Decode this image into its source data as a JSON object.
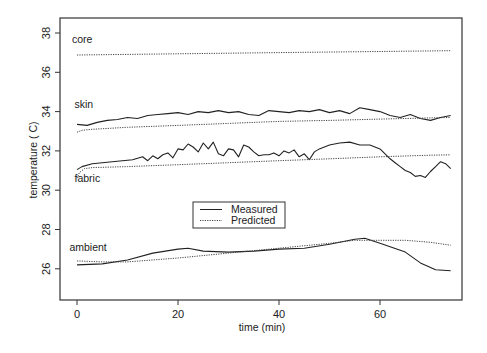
{
  "chart_data": {
    "type": "line",
    "title": "",
    "xlabel": "time (min)",
    "ylabel": "temperature ( C)",
    "xlim": [
      -3,
      77
    ],
    "ylim": [
      24.5,
      38.3
    ],
    "xticks": [
      0,
      20,
      40,
      60
    ],
    "yticks": [
      26,
      28,
      30,
      32,
      34,
      36,
      38
    ],
    "grid": false,
    "legend": {
      "position": "center",
      "entries": [
        {
          "label": "Measured",
          "style": "solid"
        },
        {
          "label": "Predicted",
          "style": "dotted"
        }
      ]
    },
    "series_labels": [
      {
        "name": "core",
        "x": -1,
        "y": 37.5
      },
      {
        "name": "skin",
        "x": -0.5,
        "y": 34.2
      },
      {
        "name": "fabric",
        "x": -0.5,
        "y": 30.4
      },
      {
        "name": "ambient",
        "x": -1.5,
        "y": 26.9
      }
    ],
    "series": [
      {
        "name": "core Predicted",
        "group": "core",
        "style": "dotted",
        "x": [
          0,
          20,
          40,
          60,
          74
        ],
        "y": [
          36.88,
          36.94,
          37.0,
          37.06,
          37.1
        ]
      },
      {
        "name": "skin Measured",
        "group": "skin",
        "style": "solid",
        "x": [
          0,
          2,
          4,
          6,
          8,
          10,
          12,
          14,
          16,
          18,
          20,
          22,
          24,
          26,
          28,
          30,
          32,
          34,
          36,
          38,
          40,
          42,
          44,
          46,
          48,
          50,
          52,
          54,
          56,
          58,
          60,
          62,
          64,
          66,
          68,
          70,
          72,
          74
        ],
        "y": [
          33.35,
          33.3,
          33.45,
          33.55,
          33.6,
          33.7,
          33.65,
          33.8,
          33.85,
          33.9,
          33.95,
          33.85,
          34.0,
          33.95,
          34.05,
          33.95,
          34.0,
          33.85,
          33.8,
          34.05,
          34.0,
          33.95,
          34.05,
          34.0,
          34.1,
          33.95,
          34.05,
          33.9,
          34.2,
          34.1,
          34.0,
          33.8,
          33.7,
          33.85,
          33.65,
          33.55,
          33.7,
          33.8
        ]
      },
      {
        "name": "skin Predicted",
        "group": "skin",
        "style": "dotted",
        "x": [
          0,
          1,
          3,
          10,
          20,
          30,
          40,
          50,
          60,
          70,
          74
        ],
        "y": [
          32.95,
          33.05,
          33.1,
          33.2,
          33.3,
          33.4,
          33.5,
          33.55,
          33.62,
          33.68,
          33.7
        ]
      },
      {
        "name": "fabric Measured",
        "group": "fabric",
        "style": "solid",
        "x": [
          0,
          1,
          3,
          5,
          7,
          9,
          11,
          13,
          14,
          15,
          16,
          17,
          18,
          19,
          20,
          21,
          22,
          23,
          24,
          25,
          26,
          27,
          28,
          29,
          30,
          31,
          32,
          33,
          34,
          35,
          36,
          37,
          38,
          39,
          40,
          41,
          42,
          43,
          44,
          45,
          46,
          47,
          48,
          49,
          50,
          52,
          54,
          56,
          58,
          60,
          62,
          63,
          64,
          65,
          66,
          67,
          68,
          69,
          70,
          71,
          72,
          73,
          74
        ],
        "y": [
          31.05,
          31.2,
          31.35,
          31.4,
          31.45,
          31.5,
          31.55,
          31.7,
          31.5,
          31.75,
          31.6,
          31.8,
          31.9,
          31.65,
          32.1,
          32.05,
          32.35,
          32.2,
          31.95,
          32.4,
          32.1,
          32.45,
          31.85,
          31.75,
          32.1,
          32.05,
          31.7,
          32.3,
          32.2,
          31.95,
          31.75,
          31.8,
          31.8,
          31.9,
          31.75,
          32.0,
          31.9,
          32.05,
          31.7,
          31.85,
          31.55,
          31.95,
          32.1,
          32.2,
          32.3,
          32.4,
          32.45,
          32.3,
          32.3,
          32.1,
          31.6,
          31.4,
          31.2,
          31.0,
          30.9,
          30.7,
          30.75,
          30.65,
          30.95,
          31.2,
          31.45,
          31.35,
          31.1
        ]
      },
      {
        "name": "fabric Predicted",
        "group": "fabric",
        "style": "dotted",
        "x": [
          0,
          0.5,
          1.5,
          3,
          10,
          20,
          30,
          40,
          50,
          60,
          70,
          74
        ],
        "y": [
          30.6,
          30.9,
          31.1,
          31.15,
          31.2,
          31.3,
          31.4,
          31.5,
          31.6,
          31.7,
          31.78,
          31.8
        ]
      },
      {
        "name": "ambient Measured",
        "group": "ambient",
        "style": "solid",
        "x": [
          0,
          5,
          10,
          15,
          20,
          22,
          25,
          30,
          35,
          40,
          45,
          50,
          55,
          57,
          60,
          65,
          68,
          71,
          74
        ],
        "y": [
          26.2,
          26.25,
          26.45,
          26.8,
          27.0,
          27.05,
          26.9,
          26.85,
          26.9,
          27.0,
          27.05,
          27.25,
          27.5,
          27.55,
          27.3,
          26.85,
          26.3,
          25.95,
          25.9
        ]
      },
      {
        "name": "ambient Predicted",
        "group": "ambient",
        "style": "dotted",
        "x": [
          0,
          5,
          10,
          20,
          30,
          40,
          50,
          55,
          60,
          65,
          70,
          74
        ],
        "y": [
          26.4,
          26.35,
          26.35,
          26.55,
          26.8,
          27.05,
          27.3,
          27.45,
          27.45,
          27.45,
          27.35,
          27.2
        ]
      }
    ]
  }
}
